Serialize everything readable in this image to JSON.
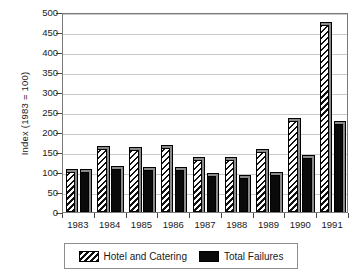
{
  "chart_data": {
    "type": "bar",
    "title": "",
    "xlabel": "",
    "ylabel": "Index (1983 = 100)",
    "ylim": [
      0,
      500
    ],
    "ytick_step": 50,
    "yticks": [
      0,
      50,
      100,
      150,
      200,
      250,
      300,
      350,
      400,
      450,
      500
    ],
    "grid": "horizontal",
    "legend_position": "bottom",
    "categories": [
      "1983",
      "1984",
      "1985",
      "1986",
      "1987",
      "1988",
      "1989",
      "1990",
      "1991"
    ],
    "series": [
      {
        "name": "Hotel and Catering",
        "fill": "diagonal-hatch",
        "color": "#111111",
        "values": [
          100,
          158,
          155,
          160,
          130,
          130,
          150,
          228,
          468
        ]
      },
      {
        "name": "Total Failures",
        "fill": "solid",
        "color": "#0a0a0a",
        "values": [
          100,
          108,
          105,
          104,
          90,
          85,
          92,
          134,
          220
        ]
      }
    ]
  },
  "legend": {
    "items": [
      {
        "label": "Hotel and Catering",
        "swatch": "diagonal-hatch-swatch"
      },
      {
        "label": "Total Failures",
        "swatch": "solid-black-swatch"
      }
    ]
  },
  "colors": {
    "axis": "#7a7a7a",
    "grid": "#c9c9c9",
    "text": "#1a1a1a",
    "bar_shadow": "#8a8a8a"
  }
}
